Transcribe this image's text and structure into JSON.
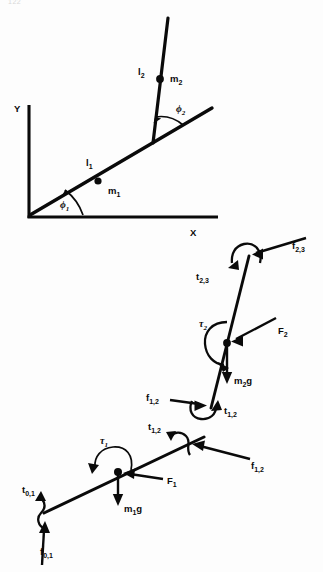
{
  "page": {
    "number": "122",
    "width": 323,
    "height": 572
  },
  "figure": {
    "kinematics": {
      "axis_labels": {
        "x": "X",
        "y": "Y"
      },
      "link1": {
        "length_label": "l",
        "length_sub": "1",
        "mass_label": "m",
        "mass_sub": "1",
        "angle_label": "ϕ",
        "angle_sub": "1"
      },
      "link2": {
        "length_label": "l",
        "length_sub": "2",
        "mass_label": "m",
        "mass_sub": "2",
        "angle_label": "ϕ",
        "angle_sub": "2"
      }
    },
    "fbd_link2": {
      "force_distal": "f",
      "force_distal_sub": "2,3",
      "torque_distal": "t",
      "torque_distal_sub": "2,3",
      "torque_actuator": "τ",
      "torque_actuator_sub": "2",
      "force_applied": "F",
      "force_applied_sub": "2",
      "weight": "m",
      "weight_sub": "2",
      "weight_tail": "g",
      "force_proximal": "f",
      "force_proximal_sub": "1,2",
      "torque_proximal": "t",
      "torque_proximal_sub": "1,2"
    },
    "fbd_link1": {
      "force_distal": "f",
      "force_distal_sub": "1,2",
      "torque_distal": "t",
      "torque_distal_sub": "1,2",
      "torque_actuator": "τ",
      "torque_actuator_sub": "1",
      "force_applied": "F",
      "force_applied_sub": "1",
      "weight": "m",
      "weight_sub": "1",
      "weight_tail": "g",
      "force_proximal": "f",
      "force_proximal_sub": "0,1",
      "torque_proximal": "t",
      "torque_proximal_sub": "0,1"
    }
  }
}
